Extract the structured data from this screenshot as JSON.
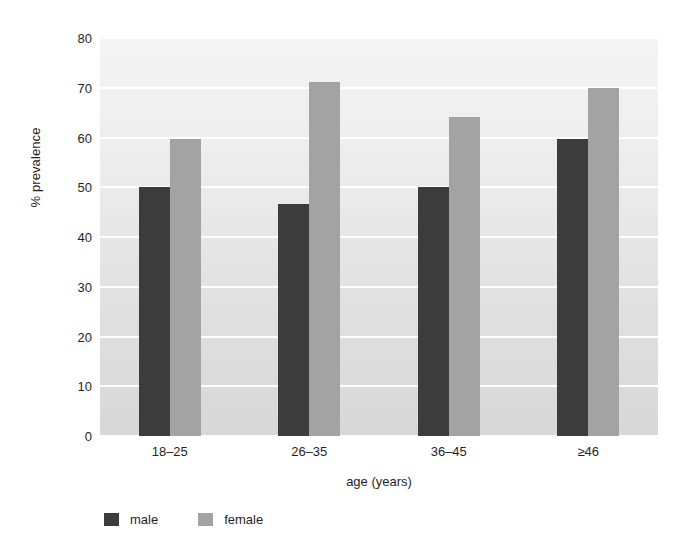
{
  "chart_data": {
    "type": "bar",
    "title": "",
    "subtitle": "",
    "xlabel": "age (years)",
    "ylabel": "% prevalence",
    "categories": [
      "18–25",
      "26–35",
      "36–45",
      "≥46"
    ],
    "series": [
      {
        "name": "male",
        "color": "#3c3c3c",
        "values": [
          50,
          46.7,
          50,
          59.8
        ]
      },
      {
        "name": "female",
        "color": "#a3a3a3",
        "values": [
          59.8,
          71.2,
          64.2,
          70
        ]
      }
    ],
    "ylim": [
      0,
      80
    ],
    "ytick_labels": [
      "0",
      "10",
      "20",
      "30",
      "40",
      "50",
      "60",
      "70",
      "80"
    ],
    "ytick_values": [
      0,
      10,
      20,
      30,
      40,
      50,
      60,
      70,
      80
    ],
    "grid": "horizontal-only",
    "gridline_color": "#ffffff",
    "plot_background": "#e8e8e8",
    "legend_position": "bottom-left",
    "legend_entries": [
      {
        "label": "male",
        "color": "#3c3c3c"
      },
      {
        "label": "female",
        "color": "#a3a3a3"
      }
    ]
  }
}
